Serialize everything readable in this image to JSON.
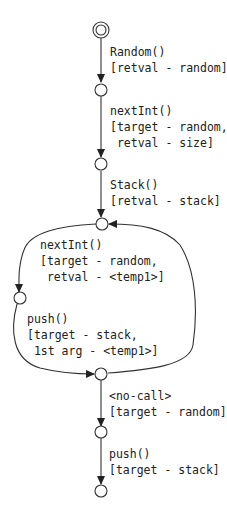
{
  "diagram": {
    "type": "state-machine",
    "nodes": [
      {
        "id": "n0",
        "kind": "start"
      },
      {
        "id": "n1",
        "kind": "state"
      },
      {
        "id": "n2",
        "kind": "state"
      },
      {
        "id": "n3",
        "kind": "state"
      },
      {
        "id": "n4",
        "kind": "state"
      },
      {
        "id": "n5",
        "kind": "state"
      },
      {
        "id": "n6",
        "kind": "state"
      },
      {
        "id": "n7",
        "kind": "state"
      }
    ],
    "edges": [
      {
        "from": "n0",
        "to": "n1",
        "label": [
          "Random()",
          "[retval - random]"
        ]
      },
      {
        "from": "n1",
        "to": "n2",
        "label": [
          "nextInt()",
          "[target - random,",
          " retval - size]"
        ]
      },
      {
        "from": "n2",
        "to": "n3",
        "label": [
          "Stack()",
          "[retval - stack]"
        ]
      },
      {
        "from": "n3",
        "to": "n4",
        "label": [
          "nextInt()",
          "[target - random,",
          " retval - <temp1>]"
        ]
      },
      {
        "from": "n4",
        "to": "n5",
        "label": [
          "push()",
          "[target - stack,",
          " 1st arg - <temp1>]"
        ]
      },
      {
        "from": "n5",
        "to": "n3",
        "label": []
      },
      {
        "from": "n5",
        "to": "n6",
        "label": [
          "<no-call>",
          "[target - random]"
        ]
      },
      {
        "from": "n6",
        "to": "n7",
        "label": [
          "push()",
          "[target - stack]"
        ]
      }
    ]
  }
}
